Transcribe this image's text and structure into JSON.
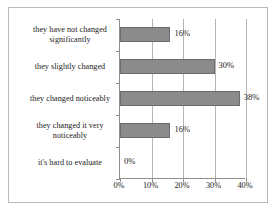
{
  "chart_data": {
    "type": "bar",
    "orientation": "horizontal",
    "title": "",
    "subtitle": "",
    "xlabel": "",
    "ylabel": "",
    "xlim": [
      0,
      40
    ],
    "xticks": [
      0,
      10,
      20,
      30,
      40
    ],
    "xtick_labels": [
      "0%",
      "10%",
      "20%",
      "30%",
      "40%"
    ],
    "grid": true,
    "grid_axis": "x",
    "legend": false,
    "legend_position": "none",
    "categories": [
      "they have not changed significantly",
      "they slightly changed",
      "they changed noticeably",
      "they changed it very noticeably",
      "it's hard to evaluate"
    ],
    "values": [
      16,
      30,
      38,
      16,
      0
    ],
    "data_labels": [
      "16%",
      "30%",
      "38%",
      "16%",
      "0%"
    ],
    "colors": {
      "bar_fill": "#8b8b8b",
      "bar_border": "#6d6d6d",
      "gridline": "#b4b4b4",
      "axis": "#8e8e8e",
      "text": "#1b1b1b",
      "frame": "#b9b9b9",
      "background": "#ffffff"
    }
  },
  "categories": [
    {
      "label": "they have not changed significantly"
    },
    {
      "label": "they slightly changed"
    },
    {
      "label": "they changed noticeably"
    },
    {
      "label": "they changed it very noticeably"
    },
    {
      "label": "it's hard to evaluate"
    }
  ],
  "bars": [
    {
      "value_label": "16%"
    },
    {
      "value_label": "30%"
    },
    {
      "value_label": "38%"
    },
    {
      "value_label": "16%"
    },
    {
      "value_label": "0%"
    }
  ],
  "axis": {
    "ticks": [
      {
        "label": "0%"
      },
      {
        "label": "10%"
      },
      {
        "label": "20%"
      },
      {
        "label": "30%"
      },
      {
        "label": "40%"
      }
    ]
  }
}
